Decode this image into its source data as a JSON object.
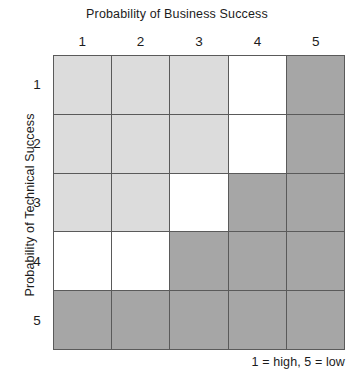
{
  "chart_data": {
    "type": "heatmap",
    "title": "Probability of Business Success",
    "xlabel": "Probability of Business Success",
    "ylabel": "Probability of Technical Success",
    "x_tick_labels": [
      "1",
      "2",
      "3",
      "4",
      "5"
    ],
    "y_tick_labels": [
      "1",
      "2",
      "3",
      "4",
      "5"
    ],
    "grid": true,
    "legend_position": "bottom-right",
    "annotations": [
      "1 = high, 5 = low"
    ],
    "categories": [
      "1",
      "2",
      "3",
      "4",
      "5"
    ],
    "color_scale": {
      "light": "#dcdcdc",
      "white": "#ffffff",
      "dark": "#a6a6a6",
      "gridline": "#5a5a5a"
    },
    "shade_values": {
      "light": 1,
      "white": 2,
      "dark": 3
    },
    "rows": [
      {
        "label": "1",
        "cells": [
          "light",
          "light",
          "light",
          "white",
          "dark"
        ],
        "values": [
          1,
          1,
          1,
          2,
          3
        ]
      },
      {
        "label": "2",
        "cells": [
          "light",
          "light",
          "light",
          "white",
          "dark"
        ],
        "values": [
          1,
          1,
          1,
          2,
          3
        ]
      },
      {
        "label": "3",
        "cells": [
          "light",
          "light",
          "white",
          "dark",
          "dark"
        ],
        "values": [
          1,
          1,
          2,
          3,
          3
        ]
      },
      {
        "label": "4",
        "cells": [
          "white",
          "white",
          "dark",
          "dark",
          "dark"
        ],
        "values": [
          2,
          2,
          3,
          3,
          3
        ]
      },
      {
        "label": "5",
        "cells": [
          "dark",
          "dark",
          "dark",
          "dark",
          "dark"
        ],
        "values": [
          3,
          3,
          3,
          3,
          3
        ]
      }
    ]
  },
  "header": {
    "title": "Probability of Business Success"
  },
  "axes": {
    "y_title": "Probability of Technical Success",
    "column_labels": [
      "1",
      "2",
      "3",
      "4",
      "5"
    ],
    "row_labels": [
      "1",
      "2",
      "3",
      "4",
      "5"
    ]
  },
  "footer": {
    "note": "1 = high, 5 = low"
  }
}
